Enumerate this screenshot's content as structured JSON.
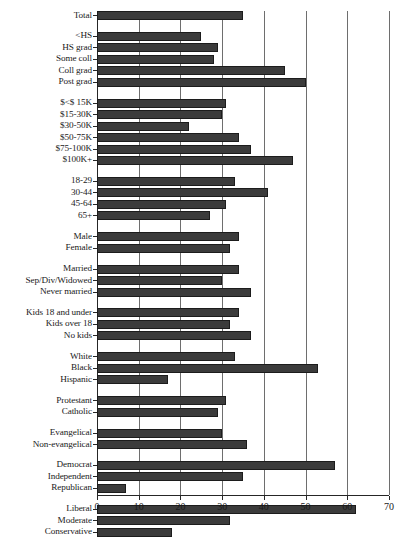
{
  "chart_data": {
    "type": "bar",
    "orientation": "horizontal",
    "title": "",
    "subtitle": "",
    "xlabel": "",
    "ylabel": "",
    "xlim": [
      0,
      70
    ],
    "xticks": [
      0,
      10,
      20,
      30,
      40,
      50,
      60,
      70
    ],
    "tick_labels": [
      "0",
      "10",
      "20",
      "30",
      "40",
      "50",
      "60",
      "70"
    ],
    "grid": "vertical",
    "legend": "none",
    "bar_color": "#3b3b3b",
    "axis_color": "#262626",
    "grid_color": "#6e6e6e",
    "groups": [
      {
        "name": "total",
        "categories": [
          "Total"
        ],
        "values": [
          35
        ]
      },
      {
        "name": "education",
        "categories": [
          "<HS",
          "HS grad",
          "Some coll",
          "Coll grad",
          "Post grad"
        ],
        "values": [
          25,
          29,
          28,
          45,
          50
        ]
      },
      {
        "name": "income",
        "categories": [
          "$<$ 15K",
          "$15-30K",
          "$30-50K",
          "$50-75K",
          "$75-100K",
          "$100K+"
        ],
        "values": [
          31,
          30,
          22,
          34,
          37,
          47
        ]
      },
      {
        "name": "age",
        "categories": [
          "18-29",
          "30-44",
          "45-64",
          "65+"
        ],
        "values": [
          33,
          41,
          31,
          27
        ]
      },
      {
        "name": "gender",
        "categories": [
          "Male",
          "Female"
        ],
        "values": [
          34,
          32
        ]
      },
      {
        "name": "marital-status",
        "categories": [
          "Married",
          "Sep/Div/Widowed",
          "Never married"
        ],
        "values": [
          34,
          30,
          37
        ]
      },
      {
        "name": "children",
        "categories": [
          "Kids 18 and under",
          "Kids over 18",
          "No kids"
        ],
        "values": [
          34,
          32,
          37
        ]
      },
      {
        "name": "race",
        "categories": [
          "White",
          "Black",
          "Hispanic"
        ],
        "values": [
          33,
          53,
          17
        ]
      },
      {
        "name": "religion",
        "categories": [
          "Protestant",
          "Catholic"
        ],
        "values": [
          31,
          29
        ]
      },
      {
        "name": "evangelical",
        "categories": [
          "Evangelical",
          "Non-evangelical"
        ],
        "values": [
          30,
          36
        ]
      },
      {
        "name": "party",
        "categories": [
          "Democrat",
          "Independent",
          "Republican"
        ],
        "values": [
          57,
          35,
          7
        ]
      },
      {
        "name": "ideology",
        "categories": [
          "Liberal",
          "Moderate",
          "Conservative"
        ],
        "values": [
          62,
          32,
          18
        ]
      },
      {
        "name": "tea-party",
        "categories": [
          "Tea party supporter",
          "Non-tea party"
        ],
        "values": [
          16,
          42
        ]
      }
    ]
  }
}
